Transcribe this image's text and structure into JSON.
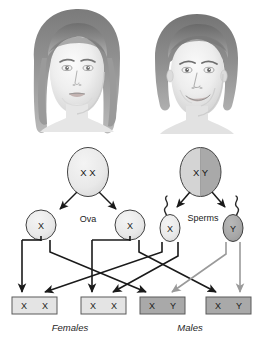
{
  "figure": {
    "colors": {
      "black_arrow": "#1a1a1a",
      "gray_arrow": "#9a9a9a",
      "cell_outline": "#3c3c3c",
      "parent_female_fill": "#ededed",
      "parent_male_x_fill": "#d2d2d2",
      "parent_male_y_fill": "#a8a8a8",
      "ovum_fill": "#e3e3e3",
      "sperm_x_fill": "#e0e0e0",
      "sperm_y_fill": "#a6a6a6",
      "offspring_female_fill": "#e4e4e4",
      "offspring_male_fill": "#a9a9a9",
      "box_outline": "#555555",
      "background": "#ffffff"
    }
  },
  "portraits": [
    {
      "id": "female-portrait",
      "label": "female parent portrait",
      "sex": "female"
    },
    {
      "id": "male-portrait",
      "label": "male parent portrait",
      "sex": "male"
    }
  ],
  "parents": [
    {
      "id": "parent-female",
      "sex": "female",
      "alleles": [
        "X",
        "X"
      ],
      "allele_text": "X  X",
      "split": false
    },
    {
      "id": "parent-male",
      "sex": "male",
      "alleles": [
        "X",
        "Y"
      ],
      "allele_text": "X  Y",
      "split": true
    }
  ],
  "gamete_labels": {
    "ova": "Ova",
    "sperms": "Sperms"
  },
  "gametes": [
    {
      "id": "ovum-1",
      "type": "ovum",
      "allele": "X",
      "tail": false,
      "arrow_color": "black"
    },
    {
      "id": "ovum-2",
      "type": "ovum",
      "allele": "X",
      "tail": false,
      "arrow_color": "black"
    },
    {
      "id": "sperm-x",
      "type": "sperm",
      "allele": "X",
      "tail": true,
      "arrow_color": "black"
    },
    {
      "id": "sperm-y",
      "type": "sperm",
      "allele": "Y",
      "tail": true,
      "arrow_color": "gray"
    }
  ],
  "offspring": [
    {
      "id": "offspring-1",
      "alleles": [
        "X",
        "X"
      ],
      "a1": "X",
      "a2": "X",
      "sex": "female"
    },
    {
      "id": "offspring-2",
      "alleles": [
        "X",
        "X"
      ],
      "a1": "X",
      "a2": "X",
      "sex": "female"
    },
    {
      "id": "offspring-3",
      "alleles": [
        "X",
        "Y"
      ],
      "a1": "X",
      "a2": "Y",
      "sex": "male"
    },
    {
      "id": "offspring-4",
      "alleles": [
        "X",
        "Y"
      ],
      "a1": "X",
      "a2": "Y",
      "sex": "male"
    }
  ],
  "outcome_labels": {
    "females": "Females",
    "males": "Males"
  }
}
